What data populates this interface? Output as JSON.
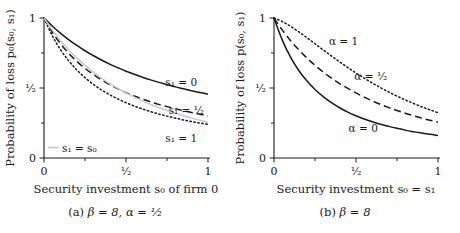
{
  "figure": {
    "panels": [
      {
        "id": "a",
        "caption_prefix": "(a)",
        "caption_body": "β = 8, α = ¹⁄₂",
        "xlabel": "Security investment s₀ of firm 0",
        "ylabel": "Probability of loss p₀(s₀, s₁)",
        "xticklabels": [
          "0",
          "¹⁄₂",
          "1"
        ],
        "yticklabels": [
          "0",
          "¹⁄₂",
          "1"
        ],
        "annotations": [
          {
            "text": "s₁ = 0",
            "x": 0.74,
            "y": 0.545
          },
          {
            "text": "s₁ = ¹⁄₂",
            "x": 0.76,
            "y": 0.34
          },
          {
            "text": "s₁ = 1",
            "x": 0.74,
            "y": 0.145
          },
          {
            "text": "s₁ = s₀",
            "x": 0.11,
            "y": 0.075
          }
        ]
      },
      {
        "id": "b",
        "caption_prefix": "(b)",
        "caption_body": "β = 8",
        "xlabel": "Security investment s₀ = s₁",
        "ylabel": "Probability of loss p(s₀, s₁)",
        "xticklabels": [
          "0",
          "¹⁄₂",
          "1"
        ],
        "yticklabels": [
          "0",
          "¹⁄₂",
          "1"
        ],
        "annotations": [
          {
            "text": "α = 1",
            "x": 0.335,
            "y": 0.835
          },
          {
            "text": "α = ¹⁄₂",
            "x": 0.49,
            "y": 0.585
          },
          {
            "text": "α = 0",
            "x": 0.455,
            "y": 0.215
          }
        ]
      }
    ]
  },
  "colors": {
    "axis": "#1a1a1a",
    "curve": "#1a1a1a",
    "curve_gray": "#c8c8c8",
    "text": "#1a1a1a",
    "background": "#ffffff"
  },
  "chart_data": [
    {
      "type": "line",
      "panel": "a",
      "title": "(a) β = 8, α = ¹⁄₂",
      "xlabel": "Security investment s₀ of firm 0",
      "ylabel": "Probability of loss p₀(s₀, s₁)",
      "xlim": [
        0,
        1
      ],
      "ylim": [
        0,
        1
      ],
      "xticks": [
        0,
        0.5,
        1
      ],
      "yticks": [
        0,
        0.5,
        1
      ],
      "grid": false,
      "legend": "inline-annotations",
      "x": [
        0,
        0.05,
        0.1,
        0.15,
        0.2,
        0.25,
        0.3,
        0.35,
        0.4,
        0.45,
        0.5,
        0.55,
        0.6,
        0.65,
        0.7,
        0.75,
        0.8,
        0.85,
        0.9,
        0.95,
        1
      ],
      "series": [
        {
          "name": "s₁ = 0",
          "style": "solid",
          "color": "#1a1a1a",
          "values": [
            1.0,
            0.943,
            0.892,
            0.846,
            0.804,
            0.766,
            0.732,
            0.7,
            0.671,
            0.645,
            0.62,
            0.598,
            0.577,
            0.558,
            0.54,
            0.524,
            0.508,
            0.494,
            0.48,
            0.468,
            0.456
          ]
        },
        {
          "name": "s₁ = ¹⁄₂",
          "style": "dashed",
          "color": "#1a1a1a",
          "values": [
            1.0,
            0.9,
            0.818,
            0.749,
            0.691,
            0.64,
            0.597,
            0.558,
            0.524,
            0.494,
            0.467,
            0.443,
            0.421,
            0.401,
            0.383,
            0.367,
            0.352,
            0.338,
            0.325,
            0.313,
            0.302
          ]
        },
        {
          "name": "s₁ = 1",
          "style": "dotted",
          "color": "#1a1a1a",
          "values": [
            1.0,
            0.874,
            0.775,
            0.695,
            0.629,
            0.574,
            0.527,
            0.487,
            0.452,
            0.422,
            0.395,
            0.371,
            0.35,
            0.331,
            0.314,
            0.299,
            0.285,
            0.272,
            0.26,
            0.25,
            0.24
          ]
        },
        {
          "name": "s₁ = s₀",
          "style": "solid",
          "color": "#c8c8c8",
          "values": [
            1.0,
            0.915,
            0.84,
            0.774,
            0.715,
            0.662,
            0.614,
            0.571,
            0.532,
            0.497,
            0.465,
            0.435,
            0.408,
            0.383,
            0.36,
            0.339,
            0.32,
            0.302,
            0.285,
            0.27,
            0.256
          ]
        }
      ]
    },
    {
      "type": "line",
      "panel": "b",
      "title": "(b) β = 8",
      "xlabel": "Security investment s₀ = s₁",
      "ylabel": "Probability of loss p(s₀, s₁)",
      "xlim": [
        0,
        1
      ],
      "ylim": [
        0,
        1
      ],
      "xticks": [
        0,
        0.5,
        1
      ],
      "yticks": [
        0,
        0.5,
        1
      ],
      "grid": false,
      "legend": "inline-annotations",
      "x": [
        0,
        0.05,
        0.1,
        0.15,
        0.2,
        0.25,
        0.3,
        0.35,
        0.4,
        0.45,
        0.5,
        0.55,
        0.6,
        0.65,
        0.7,
        0.75,
        0.8,
        0.85,
        0.9,
        0.95,
        1
      ],
      "series": [
        {
          "name": "α = 0",
          "style": "solid",
          "color": "#1a1a1a",
          "values": [
            1.0,
            0.844,
            0.723,
            0.627,
            0.551,
            0.489,
            0.438,
            0.395,
            0.359,
            0.328,
            0.302,
            0.279,
            0.259,
            0.241,
            0.226,
            0.212,
            0.199,
            0.188,
            0.178,
            0.169,
            0.161
          ]
        },
        {
          "name": "α = ¹⁄₂",
          "style": "dashed",
          "color": "#1a1a1a",
          "values": [
            1.0,
            0.915,
            0.84,
            0.774,
            0.715,
            0.662,
            0.614,
            0.571,
            0.532,
            0.497,
            0.465,
            0.435,
            0.408,
            0.383,
            0.36,
            0.339,
            0.32,
            0.302,
            0.285,
            0.27,
            0.256
          ]
        },
        {
          "name": "α = 1",
          "style": "dotted",
          "color": "#1a1a1a",
          "values": [
            1.0,
            0.975,
            0.941,
            0.902,
            0.86,
            0.816,
            0.772,
            0.729,
            0.687,
            0.646,
            0.607,
            0.57,
            0.535,
            0.502,
            0.471,
            0.442,
            0.415,
            0.39,
            0.366,
            0.344,
            0.324
          ]
        }
      ]
    }
  ]
}
